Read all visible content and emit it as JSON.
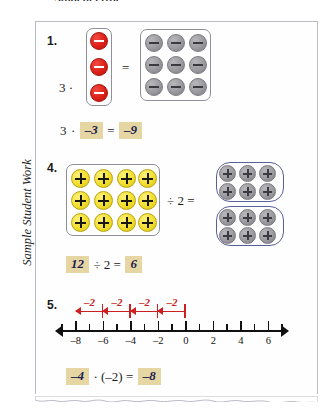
{
  "page": {
    "top_heading": "Student error.",
    "side_caption": "Sample Student Work"
  },
  "problems": [
    {
      "number": "1.",
      "model": {
        "left_group": {
          "count": 3,
          "color": "red",
          "sign": "minus",
          "rows": 3,
          "cols": 1
        },
        "operator_left": "3 ·",
        "equals": "=",
        "right_group": {
          "count": 9,
          "color": "gray",
          "sign": "minus",
          "rows": 3,
          "cols": 3
        }
      },
      "equation": {
        "printed_1": "3",
        "dot": "·",
        "answer_1": "–3",
        "equals": "=",
        "answer_2": "–9"
      }
    },
    {
      "number": "4.",
      "model": {
        "left_group": {
          "count": 12,
          "color": "yellow",
          "sign": "plus",
          "rows": 3,
          "cols": 4
        },
        "operator_mid": "÷ 2 =",
        "right_groups": [
          {
            "count": 6,
            "color": "gray",
            "sign": "plus",
            "rows": 2,
            "cols": 3
          },
          {
            "count": 6,
            "color": "gray",
            "sign": "plus",
            "rows": 2,
            "cols": 3
          }
        ]
      },
      "equation": {
        "answer_1": "12",
        "printed_1": "÷ 2 =",
        "answer_2": "6"
      }
    },
    {
      "number": "5.",
      "numberline": {
        "min": -9,
        "max": 7,
        "labeled_ticks": [
          {
            "value": -8,
            "label": "–8"
          },
          {
            "value": -6,
            "label": "–6"
          },
          {
            "value": -4,
            "label": "–4"
          },
          {
            "value": -2,
            "label": "–2"
          },
          {
            "value": 0,
            "label": "0"
          },
          {
            "value": 2,
            "label": "2"
          },
          {
            "value": 4,
            "label": "4"
          },
          {
            "value": 6,
            "label": "6"
          }
        ],
        "jumps": [
          {
            "from": 0,
            "to": -2,
            "label": "–2"
          },
          {
            "from": -2,
            "to": -4,
            "label": "–2"
          },
          {
            "from": -4,
            "to": -6,
            "label": "–2"
          },
          {
            "from": -6,
            "to": -8,
            "label": "–2"
          }
        ],
        "jump_color": "#cc1f1f"
      },
      "equation": {
        "answer_1": "–4",
        "printed_1": "· (–2) =",
        "answer_2": "–8"
      }
    }
  ],
  "colors": {
    "highlight": "#e6d6a4",
    "handwriting": "#1b2250",
    "red_counter": "#dc2018",
    "gray_counter": "#9a9a9f",
    "yellow_counter": "#f2de2e",
    "group_oval": "#5a5f96",
    "sheet_border": "#b9bcc4"
  },
  "chart_data": {
    "type": "line",
    "xlabel": "",
    "ylabel": "",
    "xlim": [
      -9,
      7
    ],
    "grid": false,
    "legend": "none",
    "tick_labels": [
      "–8",
      "–6",
      "–4",
      "–2",
      "0",
      "2",
      "4",
      "6"
    ],
    "tick_values": [
      -8,
      -6,
      -4,
      -2,
      0,
      2,
      4,
      6
    ],
    "annotations": [
      {
        "label": "–2",
        "from": 0,
        "to": -2
      },
      {
        "label": "–2",
        "from": -2,
        "to": -4
      },
      {
        "label": "–2",
        "from": -4,
        "to": -6
      },
      {
        "label": "–2",
        "from": -6,
        "to": -8
      }
    ]
  }
}
